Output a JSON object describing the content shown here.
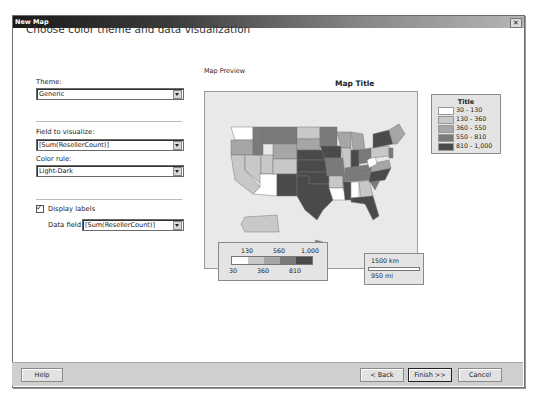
{
  "window": {
    "title": "New Map",
    "close_label": "x"
  },
  "heading": "Choose color theme and data visualization",
  "theme": {
    "label": "Theme:",
    "value": "Generic"
  },
  "field": {
    "label": "Field to visualize:",
    "value": "[Sum(ResellerCount)]"
  },
  "color_rule": {
    "label": "Color rule:",
    "value": "Light-Dark"
  },
  "display_labels": {
    "label": "Display labels",
    "checked": true
  },
  "data_field": {
    "label": "Data field:",
    "value": "[Sum(ResellerCount)]"
  },
  "preview": {
    "label": "Map Preview",
    "map_title": "Map Title",
    "legend": {
      "title": "Title",
      "items": [
        {
          "range": "30 - 130",
          "color": "#ffffff"
        },
        {
          "range": "130 - 360",
          "color": "#c8c8c8"
        },
        {
          "range": "360 - 550",
          "color": "#a6a6a6"
        },
        {
          "range": "550 - 810",
          "color": "#7a7a7a"
        },
        {
          "range": "810 - 1,000",
          "color": "#4a4a4a"
        }
      ]
    },
    "color_scale": {
      "top_labels": [
        "130",
        "560",
        "1,000"
      ],
      "bottom_labels": [
        "30",
        "360",
        "810"
      ],
      "colors": [
        "#ffffff",
        "#c8c8c8",
        "#a6a6a6",
        "#7a7a7a",
        "#4a4a4a"
      ]
    },
    "distance_scale": {
      "km": "1500 km",
      "mi": "950 mi"
    }
  },
  "footer": {
    "help": "Help",
    "back": "< Back",
    "finish": "Finish >>",
    "cancel": "Cancel"
  }
}
